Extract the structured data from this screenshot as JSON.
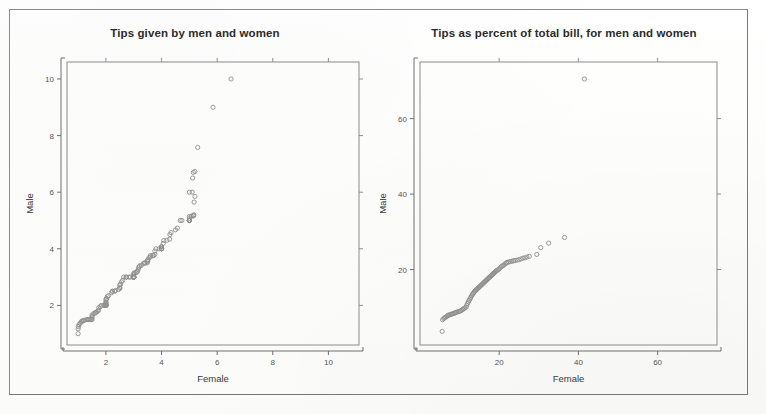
{
  "page": {
    "background_color": "#fefefe",
    "frame_color": "#8b8b8b"
  },
  "charts": [
    {
      "id": "left",
      "title": "Tips given by men and women",
      "xlabel": "Female",
      "ylabel": "Male"
    },
    {
      "id": "right",
      "title": "Tips as percent of total bill, for men and women",
      "xlabel": "Female",
      "ylabel": "Male"
    }
  ],
  "chart_data": [
    {
      "type": "scatter",
      "title": "Tips given by men and women",
      "subtitle": "",
      "xlabel": "Female",
      "ylabel": "Male",
      "xlim": [
        0.6,
        11.1
      ],
      "ylim": [
        0.6,
        10.6
      ],
      "xticks": [
        2,
        4,
        6,
        8,
        10
      ],
      "yticks": [
        2,
        4,
        6,
        8,
        10
      ],
      "grid": false,
      "legend": null,
      "marker": "open-circle",
      "marker_color": "#8e8e8e",
      "points": [
        [
          1.0,
          1.0
        ],
        [
          1.0,
          1.17
        ],
        [
          1.01,
          1.25
        ],
        [
          1.03,
          1.32
        ],
        [
          1.07,
          1.36
        ],
        [
          1.1,
          1.4
        ],
        [
          1.13,
          1.44
        ],
        [
          1.17,
          1.45
        ],
        [
          1.2,
          1.47
        ],
        [
          1.25,
          1.48
        ],
        [
          1.32,
          1.5
        ],
        [
          1.36,
          1.5
        ],
        [
          1.4,
          1.5
        ],
        [
          1.44,
          1.5
        ],
        [
          1.48,
          1.5
        ],
        [
          1.5,
          1.5
        ],
        [
          1.5,
          1.56
        ],
        [
          1.5,
          1.61
        ],
        [
          1.5,
          1.66
        ],
        [
          1.56,
          1.71
        ],
        [
          1.61,
          1.73
        ],
        [
          1.63,
          1.75
        ],
        [
          1.66,
          1.76
        ],
        [
          1.71,
          1.8
        ],
        [
          1.73,
          1.83
        ],
        [
          1.75,
          1.92
        ],
        [
          1.8,
          1.96
        ],
        [
          1.83,
          2.0
        ],
        [
          1.92,
          2.0
        ],
        [
          1.96,
          2.0
        ],
        [
          2.0,
          2.0
        ],
        [
          2.0,
          2.0
        ],
        [
          2.0,
          2.0
        ],
        [
          2.0,
          2.0
        ],
        [
          2.0,
          2.01
        ],
        [
          2.0,
          2.03
        ],
        [
          2.0,
          2.06
        ],
        [
          2.0,
          2.09
        ],
        [
          2.0,
          2.12
        ],
        [
          2.0,
          2.2
        ],
        [
          2.01,
          2.23
        ],
        [
          2.03,
          2.24
        ],
        [
          2.05,
          2.31
        ],
        [
          2.09,
          2.34
        ],
        [
          2.2,
          2.45
        ],
        [
          2.23,
          2.5
        ],
        [
          2.24,
          2.5
        ],
        [
          2.31,
          2.5
        ],
        [
          2.34,
          2.52
        ],
        [
          2.45,
          2.56
        ],
        [
          2.5,
          2.6
        ],
        [
          2.5,
          2.64
        ],
        [
          2.5,
          2.72
        ],
        [
          2.52,
          2.74
        ],
        [
          2.56,
          2.83
        ],
        [
          2.6,
          2.88
        ],
        [
          2.64,
          3.0
        ],
        [
          2.72,
          3.0
        ],
        [
          2.74,
          3.0
        ],
        [
          2.83,
          3.0
        ],
        [
          2.88,
          3.0
        ],
        [
          3.0,
          3.0
        ],
        [
          3.0,
          3.0
        ],
        [
          3.0,
          3.0
        ],
        [
          3.0,
          3.0
        ],
        [
          3.0,
          3.0
        ],
        [
          3.0,
          3.0
        ],
        [
          3.0,
          3.0
        ],
        [
          3.0,
          3.02
        ],
        [
          3.0,
          3.08
        ],
        [
          3.0,
          3.12
        ],
        [
          3.02,
          3.15
        ],
        [
          3.08,
          3.16
        ],
        [
          3.12,
          3.18
        ],
        [
          3.14,
          3.21
        ],
        [
          3.16,
          3.27
        ],
        [
          3.18,
          3.35
        ],
        [
          3.21,
          3.39
        ],
        [
          3.27,
          3.41
        ],
        [
          3.35,
          3.48
        ],
        [
          3.39,
          3.5
        ],
        [
          3.41,
          3.5
        ],
        [
          3.48,
          3.5
        ],
        [
          3.5,
          3.55
        ],
        [
          3.5,
          3.6
        ],
        [
          3.5,
          3.6
        ],
        [
          3.55,
          3.68
        ],
        [
          3.6,
          3.71
        ],
        [
          3.6,
          3.76
        ],
        [
          3.68,
          3.76
        ],
        [
          3.71,
          3.76
        ],
        [
          3.76,
          3.8
        ],
        [
          3.76,
          3.92
        ],
        [
          3.8,
          4.0
        ],
        [
          3.92,
          4.0
        ],
        [
          4.0,
          4.0
        ],
        [
          4.0,
          4.0
        ],
        [
          4.0,
          4.0
        ],
        [
          4.0,
          4.0
        ],
        [
          4.0,
          4.06
        ],
        [
          4.0,
          4.08
        ],
        [
          4.06,
          4.19
        ],
        [
          4.08,
          4.29
        ],
        [
          4.19,
          4.3
        ],
        [
          4.29,
          4.34
        ],
        [
          4.3,
          4.5
        ],
        [
          4.34,
          4.57
        ],
        [
          4.5,
          4.67
        ],
        [
          4.57,
          4.73
        ],
        [
          4.67,
          5.0
        ],
        [
          4.73,
          5.0
        ],
        [
          5.0,
          5.0
        ],
        [
          5.0,
          5.0
        ],
        [
          5.0,
          5.0
        ],
        [
          5.0,
          5.0
        ],
        [
          5.0,
          5.0
        ],
        [
          5.0,
          5.07
        ],
        [
          5.0,
          5.14
        ],
        [
          5.07,
          5.15
        ],
        [
          5.14,
          5.16
        ],
        [
          5.15,
          5.17
        ],
        [
          5.16,
          5.2
        ],
        [
          5.17,
          5.65
        ],
        [
          5.2,
          5.85
        ],
        [
          5.0,
          6.0
        ],
        [
          5.1,
          6.0
        ],
        [
          5.12,
          6.5
        ],
        [
          5.14,
          6.7
        ],
        [
          5.2,
          6.73
        ],
        [
          5.3,
          7.58
        ],
        [
          5.85,
          9.0
        ],
        [
          6.5,
          10.0
        ]
      ],
      "annotations": [
        {
          "text": "outlier",
          "x": 6.5,
          "y": 10.0
        },
        {
          "text": "outlier",
          "x": 5.85,
          "y": 9.0
        }
      ]
    },
    {
      "type": "scatter",
      "title": "Tips as percent of total bill, for men and women",
      "subtitle": "",
      "xlabel": "Female",
      "ylabel": "Male",
      "xlim": [
        0,
        75
      ],
      "ylim": [
        0,
        75
      ],
      "xticks": [
        20,
        40,
        60
      ],
      "yticks": [
        20,
        40,
        60
      ],
      "grid": false,
      "legend": null,
      "marker": "open-circle",
      "marker_color": "#8e8e8e",
      "points": [
        [
          5.6,
          3.6
        ],
        [
          5.7,
          6.7
        ],
        [
          6.0,
          7.0
        ],
        [
          6.2,
          7.2
        ],
        [
          6.5,
          7.4
        ],
        [
          6.8,
          7.6
        ],
        [
          7.0,
          7.8
        ],
        [
          7.2,
          7.9
        ],
        [
          7.5,
          8.0
        ],
        [
          7.8,
          8.1
        ],
        [
          8.0,
          8.2
        ],
        [
          8.3,
          8.3
        ],
        [
          8.6,
          8.4
        ],
        [
          8.8,
          8.5
        ],
        [
          9.0,
          8.6
        ],
        [
          9.3,
          8.7
        ],
        [
          9.6,
          8.8
        ],
        [
          9.9,
          8.9
        ],
        [
          10.2,
          9.0
        ],
        [
          10.5,
          9.2
        ],
        [
          10.8,
          9.4
        ],
        [
          11.0,
          9.6
        ],
        [
          11.3,
          9.8
        ],
        [
          11.6,
          10.0
        ],
        [
          11.8,
          10.5
        ],
        [
          12.0,
          11.0
        ],
        [
          12.2,
          11.4
        ],
        [
          12.4,
          11.8
        ],
        [
          12.6,
          12.2
        ],
        [
          12.8,
          12.6
        ],
        [
          13.0,
          13.0
        ],
        [
          13.2,
          13.3
        ],
        [
          13.4,
          13.6
        ],
        [
          13.6,
          13.9
        ],
        [
          13.8,
          14.2
        ],
        [
          14.0,
          14.4
        ],
        [
          14.2,
          14.6
        ],
        [
          14.4,
          14.8
        ],
        [
          14.6,
          15.0
        ],
        [
          14.8,
          15.2
        ],
        [
          15.0,
          15.4
        ],
        [
          15.2,
          15.6
        ],
        [
          15.4,
          15.8
        ],
        [
          15.6,
          16.0
        ],
        [
          15.8,
          16.2
        ],
        [
          16.0,
          16.4
        ],
        [
          16.2,
          16.6
        ],
        [
          16.4,
          16.8
        ],
        [
          16.6,
          17.0
        ],
        [
          16.8,
          17.2
        ],
        [
          17.0,
          17.4
        ],
        [
          17.2,
          17.6
        ],
        [
          17.4,
          17.8
        ],
        [
          17.6,
          18.0
        ],
        [
          17.8,
          18.2
        ],
        [
          18.0,
          18.4
        ],
        [
          18.2,
          18.6
        ],
        [
          18.4,
          18.8
        ],
        [
          18.6,
          19.0
        ],
        [
          18.8,
          19.2
        ],
        [
          19.0,
          19.4
        ],
        [
          19.2,
          19.6
        ],
        [
          19.5,
          19.8
        ],
        [
          19.8,
          20.0
        ],
        [
          20.0,
          20.2
        ],
        [
          20.3,
          20.5
        ],
        [
          20.6,
          20.8
        ],
        [
          20.9,
          21.0
        ],
        [
          21.2,
          21.2
        ],
        [
          21.5,
          21.5
        ],
        [
          21.8,
          21.7
        ],
        [
          22.0,
          21.9
        ],
        [
          22.4,
          22.0
        ],
        [
          22.8,
          22.1
        ],
        [
          23.2,
          22.2
        ],
        [
          23.6,
          22.3
        ],
        [
          24.0,
          22.4
        ],
        [
          24.5,
          22.5
        ],
        [
          25.0,
          22.6
        ],
        [
          25.5,
          22.8
        ],
        [
          26.0,
          23.0
        ],
        [
          26.5,
          23.1
        ],
        [
          27.0,
          23.3
        ],
        [
          27.6,
          23.5
        ],
        [
          29.5,
          24.0
        ],
        [
          30.5,
          25.8
        ],
        [
          32.5,
          27.0
        ],
        [
          36.5,
          28.5
        ],
        [
          41.5,
          70.5
        ]
      ],
      "annotations": [
        {
          "text": "outlier",
          "x": 41.5,
          "y": 70.5
        }
      ]
    }
  ]
}
